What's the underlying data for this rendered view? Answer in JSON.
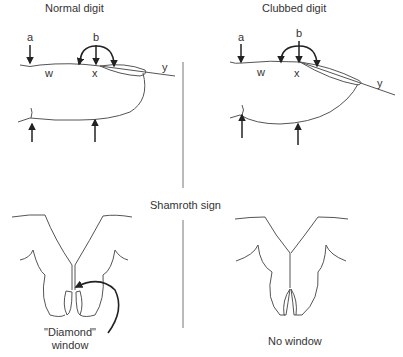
{
  "titles": {
    "normal": "Normal digit",
    "clubbed": "Clubbed digit",
    "shamroth": "Shamroth sign"
  },
  "markers": {
    "a": "a",
    "b": "b",
    "w": "w",
    "x": "x",
    "y": "y"
  },
  "captions": {
    "diamond_line1": "\"Diamond\"",
    "diamond_line2": "window",
    "no_window": "No window"
  },
  "colors": {
    "line": "#555555",
    "arrow": "#222222"
  }
}
